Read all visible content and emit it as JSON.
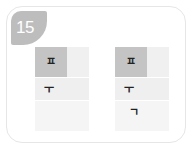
{
  "badge": {
    "number": "15",
    "color": "#bdbdbd"
  },
  "grids": [
    {
      "rows": [
        {
          "glyph": "ㅍ",
          "highlighted": true
        },
        {
          "glyph": "ㅜ"
        },
        {
          "glyph": ""
        }
      ]
    },
    {
      "rows": [
        {
          "glyph": "ㅍ",
          "highlighted": true
        },
        {
          "glyph": "ㅜ"
        },
        {
          "glyph": "ㄱ"
        }
      ]
    }
  ],
  "colors": {
    "highlight": "#c4c4c4",
    "cell": "#efefef",
    "border": "#e6e6e6"
  }
}
